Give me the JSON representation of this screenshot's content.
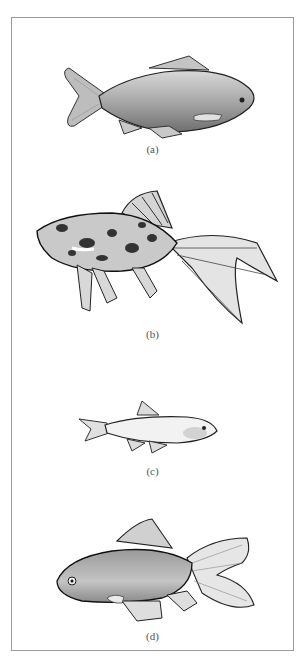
{
  "figure": {
    "panels": [
      {
        "id": "a",
        "label": "(a)",
        "description": "common goldfish"
      },
      {
        "id": "b",
        "label": "(b)",
        "description": "calico fantail goldfish"
      },
      {
        "id": "c",
        "label": "(c)",
        "description": "slender fish"
      },
      {
        "id": "d",
        "label": "(d)",
        "description": "fantail goldfish"
      }
    ]
  },
  "colors": {
    "border": "#9a9a9a",
    "outline": "#222222",
    "body_fill": "#b8b8b8",
    "fin_fill": "#d6d6d6",
    "label": "#555555"
  }
}
